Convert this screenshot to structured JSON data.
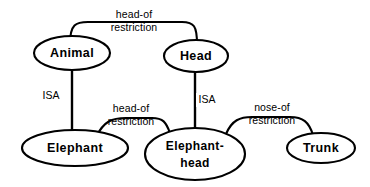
{
  "diagram": {
    "type": "semantic-network",
    "background_color": "#ffffff",
    "stroke_color": "#000000",
    "nodes": [
      {
        "id": "animal",
        "label": "Animal",
        "label_line2": "",
        "cx": 72,
        "cy": 53,
        "rx": 38,
        "ry": 17
      },
      {
        "id": "head",
        "label": "Head",
        "label_line2": "",
        "cx": 196,
        "cy": 56,
        "rx": 32,
        "ry": 16
      },
      {
        "id": "elephant",
        "label": "Elephant",
        "label_line2": "",
        "cx": 75,
        "cy": 148,
        "rx": 53,
        "ry": 18
      },
      {
        "id": "elephant-head",
        "label": "Elephant-",
        "label_line2": "head",
        "cx": 195,
        "cy": 154,
        "rx": 50,
        "ry": 26
      },
      {
        "id": "trunk",
        "label": "Trunk",
        "label_line2": "",
        "cx": 321,
        "cy": 148,
        "rx": 34,
        "ry": 15
      }
    ],
    "edges": [
      {
        "id": "animal-elephant-isa",
        "from": "animal",
        "to": "elephant",
        "label": "ISA",
        "label2": "",
        "style": "straight"
      },
      {
        "id": "head-elephanthead-isa",
        "from": "head",
        "to": "elephant-head",
        "label": "ISA",
        "label2": "",
        "style": "straight"
      },
      {
        "id": "animal-head-headof",
        "from": "animal",
        "to": "head",
        "label": "head-of",
        "label2": "restriction",
        "style": "arc"
      },
      {
        "id": "elephant-ehead-headof",
        "from": "elephant",
        "to": "elephant-head",
        "label": "head-of",
        "label2": "restriction",
        "style": "arc"
      },
      {
        "id": "ehead-trunk-noseof",
        "from": "elephant-head",
        "to": "trunk",
        "label": "nose-of",
        "label2": "restriction",
        "style": "arc"
      }
    ]
  }
}
